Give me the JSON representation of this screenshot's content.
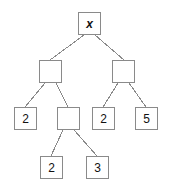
{
  "diagram": {
    "type": "binary-tree",
    "canvas": {
      "width": 173,
      "height": 196,
      "background": "#ffffff"
    },
    "style": {
      "node_fill": "#ffffff",
      "node_border": "#8a8a8a",
      "edge_color": "#8a8a8a",
      "text_color": "#111111",
      "node_size": 23,
      "border_width": 1,
      "edge_width": 1
    },
    "nodes": [
      {
        "id": "n0",
        "label": "x",
        "italic": true,
        "x": 78,
        "y": 12,
        "w": 23,
        "h": 23,
        "level": 0
      },
      {
        "id": "n1",
        "label": "",
        "italic": false,
        "x": 39,
        "y": 60,
        "w": 23,
        "h": 23,
        "level": 1
      },
      {
        "id": "n2",
        "label": "",
        "italic": false,
        "x": 112,
        "y": 60,
        "w": 23,
        "h": 23,
        "level": 1
      },
      {
        "id": "n3",
        "label": "2",
        "italic": false,
        "x": 14,
        "y": 107,
        "w": 23,
        "h": 23,
        "level": 2
      },
      {
        "id": "n4",
        "label": "",
        "italic": false,
        "x": 57,
        "y": 107,
        "w": 23,
        "h": 23,
        "level": 2
      },
      {
        "id": "n5",
        "label": "2",
        "italic": false,
        "x": 92,
        "y": 107,
        "w": 23,
        "h": 23,
        "level": 2
      },
      {
        "id": "n6",
        "label": "5",
        "italic": false,
        "x": 135,
        "y": 107,
        "w": 23,
        "h": 23,
        "level": 2
      },
      {
        "id": "n7",
        "label": "2",
        "italic": false,
        "x": 40,
        "y": 156,
        "w": 23,
        "h": 23,
        "level": 3
      },
      {
        "id": "n8",
        "label": "3",
        "italic": false,
        "x": 86,
        "y": 156,
        "w": 23,
        "h": 23,
        "level": 3
      }
    ],
    "edges": [
      {
        "from": "n0",
        "to": "n1",
        "x1": 84,
        "y1": 35,
        "x2": 50,
        "y2": 60
      },
      {
        "from": "n0",
        "to": "n2",
        "x1": 95,
        "y1": 35,
        "x2": 124,
        "y2": 60
      },
      {
        "from": "n1",
        "to": "n3",
        "x1": 45,
        "y1": 83,
        "x2": 25,
        "y2": 107
      },
      {
        "from": "n1",
        "to": "n4",
        "x1": 56,
        "y1": 83,
        "x2": 68,
        "y2": 107
      },
      {
        "from": "n2",
        "to": "n5",
        "x1": 118,
        "y1": 83,
        "x2": 103,
        "y2": 107
      },
      {
        "from": "n2",
        "to": "n6",
        "x1": 129,
        "y1": 83,
        "x2": 146,
        "y2": 107
      },
      {
        "from": "n4",
        "to": "n7",
        "x1": 63,
        "y1": 130,
        "x2": 51,
        "y2": 156
      },
      {
        "from": "n4",
        "to": "n8",
        "x1": 74,
        "y1": 130,
        "x2": 97,
        "y2": 156
      }
    ]
  }
}
